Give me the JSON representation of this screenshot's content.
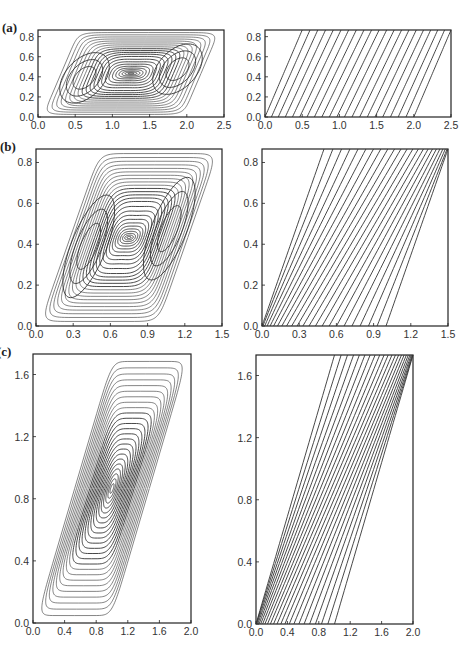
{
  "figure": {
    "panels": [
      {
        "label": "(a)",
        "xlim": [
          0,
          2.5
        ],
        "ylim": [
          0,
          0.866
        ],
        "xticks": [
          "0.0",
          "0.5",
          "1.0",
          "1.5",
          "2.0",
          "2.5"
        ],
        "yticks": [
          "0.0",
          "0.2",
          "0.4",
          "0.6",
          "0.8"
        ],
        "left_plot": "streamlines (two recirculating eddies)",
        "right_plot": "isotherms"
      },
      {
        "label": "(b)",
        "xlim": [
          0,
          1.5
        ],
        "ylim": [
          0,
          0.866
        ],
        "xticks": [
          "0.0",
          "0.3",
          "0.6",
          "0.9",
          "1.2",
          "1.5"
        ],
        "yticks": [
          "0.0",
          "0.2",
          "0.4",
          "0.6",
          "0.8"
        ],
        "left_plot": "streamlines (two eddies)",
        "right_plot": "isotherms"
      },
      {
        "label": "(c)",
        "xlim": [
          0,
          2.0
        ],
        "ylim": [
          0,
          1.732
        ],
        "xticks": [
          "0.0",
          "0.4",
          "0.8",
          "1.2",
          "1.6",
          "2.0"
        ],
        "yticks": [
          "0.0",
          "0.4",
          "0.8",
          "1.2",
          "1.6"
        ],
        "left_plot": "streamlines (single eddy)",
        "right_plot": "isotherms"
      }
    ]
  },
  "chart_data": [
    {
      "type": "contour",
      "title": "(a) streamlines",
      "xlim": [
        0,
        2.5
      ],
      "ylim": [
        0,
        0.866
      ],
      "domain": "parallelogram (0,0)-(2,0)-(2.5,0.866)-(0.5,0.866)",
      "features": "two symmetric cells centered near x=0.4,y=0.4 and x=2.1,y=0.45"
    },
    {
      "type": "contour",
      "title": "(a) isotherms",
      "xlim": [
        0,
        2.5
      ],
      "ylim": [
        0,
        0.866
      ],
      "features": "~20 inclined isotherm lines"
    },
    {
      "type": "contour",
      "title": "(b) streamlines",
      "xlim": [
        0,
        1.5
      ],
      "ylim": [
        0,
        0.866
      ],
      "domain": "parallelogram (0,0)-(1,0)-(1.5,0.866)-(0.5,0.866)",
      "features": "two cells near (0.4,0.3) and (1.15,0.5)"
    },
    {
      "type": "contour",
      "title": "(b) isotherms",
      "xlim": [
        0,
        1.5
      ],
      "ylim": [
        0,
        0.866
      ],
      "features": "~22 isotherms"
    },
    {
      "type": "contour",
      "title": "(c) streamlines",
      "xlim": [
        0,
        2.0
      ],
      "ylim": [
        0,
        1.732
      ],
      "domain": "parallelogram (0,0)-(1,0)-(2,1.732)-(1,1.732)",
      "features": "single elongated cell centered near (1.0,0.85)"
    },
    {
      "type": "contour",
      "title": "(c) isotherms",
      "xlim": [
        0,
        2.0
      ],
      "ylim": [
        0,
        1.732
      ],
      "features": "~22 isotherms"
    }
  ]
}
